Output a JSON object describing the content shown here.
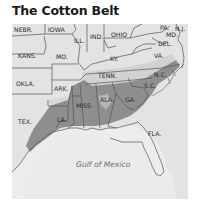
{
  "title": "The Cotton Belt",
  "map": {
    "colors": {
      "background": "#e6e6e6",
      "land": "#e3e3e3",
      "light_shade": "#cfcfcf",
      "cotton_belt": "#8e8e8e",
      "border": "#555555",
      "water_label": "#6e6e6e"
    },
    "water_label": "Gulf of Mexico",
    "states": [
      {
        "id": "nebr",
        "label": "NEBR.",
        "shaded": false
      },
      {
        "id": "iowa",
        "label": "IOWA",
        "shaded": false
      },
      {
        "id": "ill",
        "label": "ILL.",
        "shaded": false
      },
      {
        "id": "ind",
        "label": "IND.",
        "shaded": false
      },
      {
        "id": "ohio",
        "label": "OHIO",
        "shaded": false
      },
      {
        "id": "pa",
        "label": "PA.",
        "shaded": false
      },
      {
        "id": "nj",
        "label": "N.J.",
        "shaded": false
      },
      {
        "id": "md",
        "label": "MD.",
        "shaded": false
      },
      {
        "id": "del",
        "label": "DEL.",
        "shaded": false
      },
      {
        "id": "kans",
        "label": "KANS.",
        "shaded": false
      },
      {
        "id": "mo",
        "label": "MO.",
        "shaded": "partial"
      },
      {
        "id": "ky",
        "label": "KY.",
        "shaded": false
      },
      {
        "id": "va",
        "label": "VA.",
        "shaded": "partial"
      },
      {
        "id": "okla",
        "label": "OKLA.",
        "shaded": "partial"
      },
      {
        "id": "ark",
        "label": "ARK.",
        "shaded": true
      },
      {
        "id": "tenn",
        "label": "TENN.",
        "shaded": "partial"
      },
      {
        "id": "nc",
        "label": "N.C.",
        "shaded": true
      },
      {
        "id": "sc",
        "label": "S.C.",
        "shaded": true
      },
      {
        "id": "tex",
        "label": "TEX.",
        "shaded": "partial"
      },
      {
        "id": "la",
        "label": "LA.",
        "shaded": true
      },
      {
        "id": "miss",
        "label": "MISS.",
        "shaded": true
      },
      {
        "id": "ala",
        "label": "ALA.",
        "shaded": true
      },
      {
        "id": "ga",
        "label": "GA.",
        "shaded": true
      },
      {
        "id": "fla",
        "label": "FLA.",
        "shaded": false
      }
    ]
  }
}
